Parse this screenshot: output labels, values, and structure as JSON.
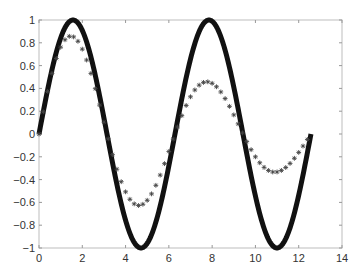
{
  "chart_data": {
    "type": "line",
    "title": "",
    "xlabel": "",
    "ylabel": "",
    "xlim": [
      0,
      14
    ],
    "ylim": [
      -1,
      1
    ],
    "grid": false,
    "legend": null,
    "x_ticks": [
      0,
      2,
      4,
      6,
      8,
      10,
      12,
      14
    ],
    "y_ticks": [
      -1,
      -0.8,
      -0.6,
      -0.4,
      -0.2,
      0,
      0.2,
      0.4,
      0.6,
      0.8,
      1
    ],
    "x_tick_labels": [
      "0",
      "2",
      "4",
      "6",
      "8",
      "10",
      "12",
      "14"
    ],
    "y_tick_labels": [
      "-1",
      "-0.8",
      "-0.6",
      "-0.4",
      "-0.2",
      "0",
      "0.2",
      "0.4",
      "0.6",
      "0.8",
      "1"
    ],
    "series": [
      {
        "name": "sin(x)",
        "style": "solid-thick-line",
        "color": "#111111",
        "x_range": [
          0,
          12.566
        ],
        "function": "sin(x)",
        "key_points": [
          [
            0,
            0
          ],
          [
            1.571,
            1
          ],
          [
            3.142,
            0
          ],
          [
            4.712,
            -1
          ],
          [
            6.283,
            0
          ],
          [
            7.854,
            1
          ],
          [
            9.425,
            0
          ],
          [
            10.996,
            -1
          ],
          [
            12.566,
            0
          ]
        ]
      },
      {
        "name": "damped sin(x)",
        "style": "star-markers",
        "color": "#444444",
        "x_range": [
          0,
          12.566
        ],
        "x_step": 0.2,
        "function": "exp(-0.1x)*sin(x)",
        "key_points": [
          [
            0,
            0
          ],
          [
            1.5,
            0.86
          ],
          [
            3.142,
            0
          ],
          [
            4.6,
            -0.63
          ],
          [
            6.283,
            0
          ],
          [
            7.8,
            0.45
          ],
          [
            9.425,
            0
          ],
          [
            10.9,
            -0.34
          ],
          [
            12.566,
            0
          ]
        ]
      }
    ]
  }
}
